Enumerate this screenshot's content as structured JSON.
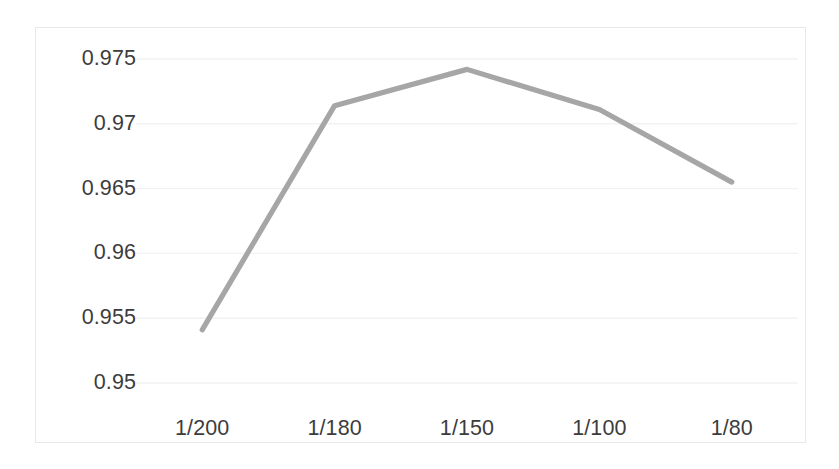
{
  "chart_data": {
    "type": "line",
    "title": "",
    "subtitle": "",
    "xlabel": "",
    "ylabel": "",
    "categories": [
      "1/200",
      "1/180",
      "1/150",
      "1/100",
      "1/80"
    ],
    "series": [
      {
        "name": "",
        "color": "#a6a6a6",
        "values": [
          0.9541,
          0.9714,
          0.9742,
          0.9711,
          0.9655
        ]
      }
    ],
    "ylim": [
      0.95,
      0.9765
    ],
    "yticks": [
      "0.95",
      "0.955",
      "0.96",
      "0.965",
      "0.97",
      "0.975"
    ],
    "ytick_values": [
      0.95,
      0.955,
      0.96,
      0.965,
      0.97,
      0.975
    ],
    "xticks": [
      "1/200",
      "1/180",
      "1/150",
      "1/100",
      "1/80"
    ],
    "grid": "horizontal",
    "legend": "none",
    "markers": "none",
    "annotations": [],
    "colors": {
      "line": "#a6a6a6",
      "gridline": "#f2f2f2",
      "plot_border": "#e8e8e8",
      "tick_text": "#3c3c3c",
      "background": "#ffffff"
    }
  }
}
